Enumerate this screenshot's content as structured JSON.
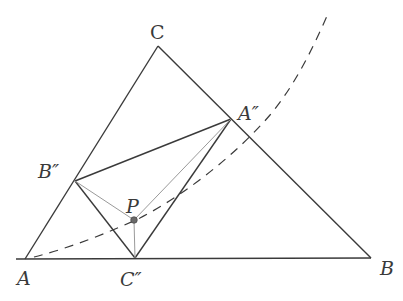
{
  "diagram": {
    "type": "geometry",
    "colors": {
      "main_line": "#3a3a3a",
      "light_line": "#9a9a9a",
      "point_fill": "#6a6a6a",
      "background": "#ffffff"
    },
    "points": {
      "A": {
        "label": "A",
        "x": 25,
        "y": 259
      },
      "B": {
        "label": "B",
        "x": 371,
        "y": 258
      },
      "C": {
        "label": "C",
        "x": 158,
        "y": 46
      },
      "A2": {
        "label": "A''",
        "x": 231,
        "y": 119
      },
      "B2": {
        "label": "B''",
        "x": 75,
        "y": 181
      },
      "C2": {
        "label": "C''",
        "x": 135,
        "y": 258
      },
      "P": {
        "label": "P",
        "x": 134,
        "y": 220
      }
    },
    "labels": {
      "A": "A",
      "B": "B",
      "C": "C",
      "A2": "A″",
      "B2": "B″",
      "C2": "C″",
      "P": "P"
    },
    "segments": [
      {
        "from": "A",
        "to": "B",
        "style": "solid-dark"
      },
      {
        "from": "B",
        "to": "C",
        "style": "solid-dark"
      },
      {
        "from": "C",
        "to": "A",
        "style": "solid-dark"
      },
      {
        "from": "A2",
        "to": "B2",
        "style": "solid-dark"
      },
      {
        "from": "B2",
        "to": "C2",
        "style": "solid-dark"
      },
      {
        "from": "C2",
        "to": "A2",
        "style": "solid-dark"
      },
      {
        "from": "P",
        "to": "A2",
        "style": "solid-light"
      },
      {
        "from": "P",
        "to": "B2",
        "style": "solid-light"
      },
      {
        "from": "P",
        "to": "C2",
        "style": "solid-light"
      }
    ],
    "curve": {
      "style": "dashed",
      "description": "dashed curve from near A rising through P and crossing A''C'' and BC, exiting at top right"
    }
  }
}
